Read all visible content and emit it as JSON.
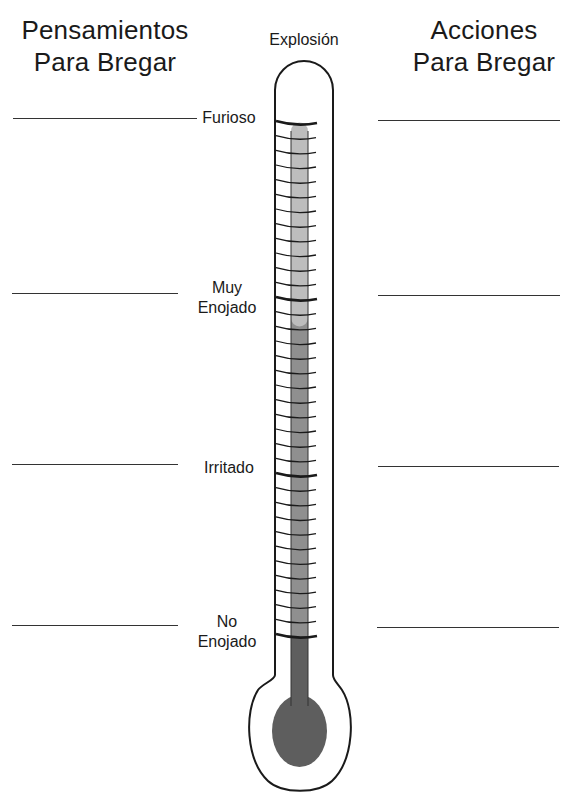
{
  "left_column": {
    "title_line1": "Pensamientos",
    "title_line2": "Para Bregar"
  },
  "right_column": {
    "title_line1": "Acciones",
    "title_line2": "Para Bregar"
  },
  "thermometer": {
    "top_label": "Explosión",
    "levels": [
      {
        "line1": "Furioso",
        "line2": ""
      },
      {
        "line1": "Muy",
        "line2": "Enojado"
      },
      {
        "line1": "Irritado",
        "line2": ""
      },
      {
        "line1": "No",
        "line2": "Enojado"
      }
    ],
    "colors": {
      "outline": "#1a1a1a",
      "fill_light": "#bdbdbd",
      "fill_medium": "#8f8f8f",
      "fill_dark": "#5e5e5e"
    }
  }
}
